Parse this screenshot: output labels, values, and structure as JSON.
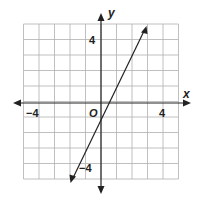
{
  "chart_data": {
    "type": "line",
    "title": "",
    "xlabel": "x",
    "ylabel": "y",
    "origin_label": "O",
    "xlim": [
      -5,
      5
    ],
    "ylim": [
      -5,
      5
    ],
    "grid": true,
    "x_tick_labels": [
      "-4",
      "4"
    ],
    "y_tick_labels": [
      "4",
      "-4"
    ],
    "series": [
      {
        "name": "line",
        "equation": "y = 2x - 1",
        "x": [
          -2,
          2.9
        ],
        "y": [
          -5,
          4.8
        ],
        "arrows_both_ends": true
      }
    ]
  },
  "labels": {
    "x_axis": "x",
    "y_axis": "y",
    "origin": "O",
    "x_neg_tick": "−4",
    "x_pos_tick": "4",
    "y_pos_tick": "4",
    "y_neg_tick": "−4"
  }
}
